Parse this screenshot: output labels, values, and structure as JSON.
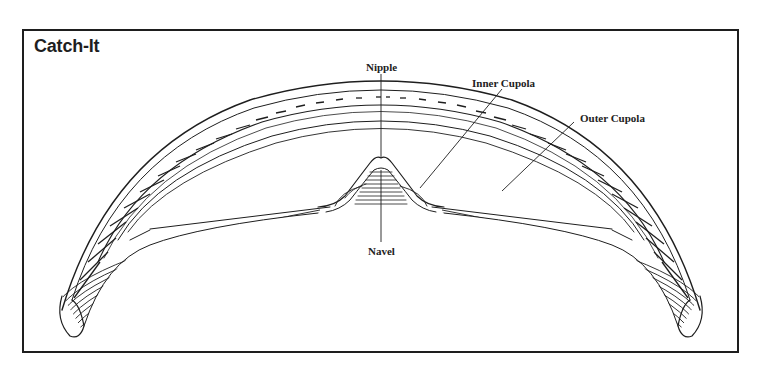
{
  "title": "Catch-It",
  "labels": {
    "nipple": "Nipple",
    "inner_cupola": "Inner Cupola",
    "outer_cupola": "Outer Cupola",
    "navel": "Navel"
  },
  "colors": {
    "ink": "#1e1e1e",
    "paper": "#ffffff"
  }
}
